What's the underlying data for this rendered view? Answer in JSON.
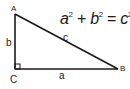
{
  "diagram": {
    "type": "right-triangle",
    "vertices": {
      "A": {
        "label": "A",
        "x": 15,
        "y": 14
      },
      "B": {
        "label": "B",
        "x": 118,
        "y": 69
      },
      "C": {
        "label": "C",
        "x": 15,
        "y": 69
      }
    },
    "sides": {
      "a": {
        "label": "a",
        "from": "C",
        "to": "B"
      },
      "b": {
        "label": "b",
        "from": "A",
        "to": "C"
      },
      "c": {
        "label": "c",
        "from": "A",
        "to": "B"
      }
    },
    "right_angle_at": "C",
    "stroke_color": "#1a1a1a"
  },
  "formula": {
    "a": "a",
    "b": "b",
    "c": "c",
    "exp": "2",
    "plus": "+",
    "equals": "="
  }
}
